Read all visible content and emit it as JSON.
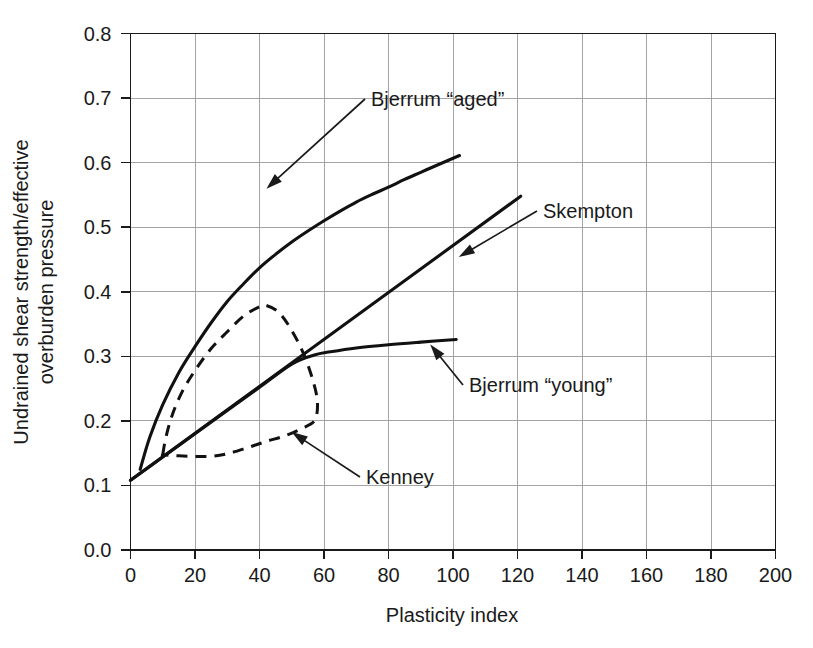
{
  "chart_data": {
    "type": "line",
    "title": "",
    "xlabel": "Plasticity index",
    "ylabel": "Undrained shear strength/effective overburden pressure",
    "xlim": [
      0,
      200
    ],
    "ylim": [
      0.0,
      0.8
    ],
    "grid": true,
    "legend_position": "inline-annotations",
    "xticks": [
      "0",
      "20",
      "40",
      "60",
      "80",
      "100",
      "120",
      "140",
      "160",
      "180",
      "200"
    ],
    "yticks": [
      "0.0",
      "0.1",
      "0.2",
      "0.3",
      "0.4",
      "0.5",
      "0.6",
      "0.7",
      "0.8"
    ],
    "series": [
      {
        "name": "Bjerrum “aged”",
        "style": "solid",
        "x": [
          3,
          6,
          10,
          15,
          20,
          25,
          30,
          35,
          40,
          45,
          50,
          55,
          60,
          65,
          70,
          75,
          80,
          85,
          90,
          95,
          102
        ],
        "values": [
          0.125,
          0.175,
          0.225,
          0.275,
          0.315,
          0.352,
          0.385,
          0.412,
          0.437,
          0.458,
          0.477,
          0.494,
          0.51,
          0.525,
          0.539,
          0.551,
          0.562,
          0.574,
          0.585,
          0.596,
          0.611
        ]
      },
      {
        "name": "Skempton",
        "style": "solid",
        "x": [
          0,
          121
        ],
        "values": [
          0.108,
          0.548
        ]
      },
      {
        "name": "Bjerrum “young”",
        "style": "solid",
        "x": [
          0,
          10,
          20,
          30,
          40,
          50,
          57,
          62,
          70,
          80,
          90,
          101
        ],
        "values": [
          0.108,
          0.144,
          0.18,
          0.216,
          0.252,
          0.288,
          0.302,
          0.307,
          0.313,
          0.318,
          0.322,
          0.326
        ]
      },
      {
        "name": "Kenney",
        "style": "dashed",
        "closed": true,
        "x": [
          10,
          11,
          13,
          16,
          20,
          25,
          30,
          35,
          40,
          42,
          46,
          50,
          54,
          57,
          58,
          57,
          53,
          48,
          42,
          36,
          30,
          25,
          20,
          15,
          11,
          10
        ],
        "values": [
          0.148,
          0.175,
          0.21,
          0.245,
          0.278,
          0.312,
          0.338,
          0.362,
          0.377,
          0.379,
          0.368,
          0.34,
          0.3,
          0.255,
          0.225,
          0.2,
          0.188,
          0.177,
          0.168,
          0.158,
          0.149,
          0.145,
          0.145,
          0.146,
          0.147,
          0.148
        ]
      }
    ],
    "annotations": [
      {
        "text": "Bjerrum “aged”",
        "label_x": 371,
        "label_y": 106,
        "tip_x": 265,
        "tip_y": 190
      },
      {
        "text": "Skempton",
        "label_x": 543,
        "label_y": 218,
        "tip_x": 457,
        "tip_y": 258
      },
      {
        "text": "Bjerrum “young”",
        "label_x": 469,
        "label_y": 392,
        "tip_x": 429,
        "tip_y": 343
      },
      {
        "text": "Kenney",
        "label_x": 366,
        "label_y": 484,
        "tip_x": 290,
        "tip_y": 431
      }
    ]
  }
}
